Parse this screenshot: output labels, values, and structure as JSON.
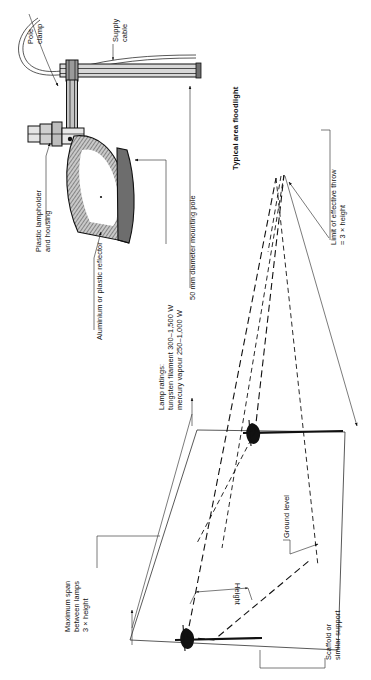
{
  "figure": {
    "title": "Typical area floodlight",
    "orientation": "rotated-90-ccw"
  },
  "upper_diagram": {
    "name": "floodlight-cross-section",
    "labels": {
      "pole_clamp": "Pole\nclamp",
      "supply_cable": "Supply\ncable",
      "lampholder": "Plastic lampholder\nand housing",
      "reflector": "Aluminium or plastic reflector",
      "lamp_ratings": "Lamp ratings:\ntungsten filament 300–1,500 W\nmercury vapour 250–1,000 W",
      "mounting_pole": "50 mm diameter mounting pole"
    },
    "values": {
      "pole_diameter_mm": 50,
      "tungsten_filament_watts": "300–1,500 W",
      "mercury_vapour_watts": "250–1,000 W"
    }
  },
  "lower_diagram": {
    "name": "floodlight-coverage-geometry",
    "labels": {
      "limit_of_throw": "Limit of effective throw\n= 3 × height",
      "ground_level": "Ground level",
      "maximum_span": "Maximum span\nbetween lamps\n3 × height",
      "height": "Height",
      "scaffold": "Scaffold or\nsimilar support"
    },
    "values": {
      "effective_throw_rule": "3 × height",
      "max_span_rule": "3 × height"
    }
  },
  "colors": {
    "ink": "#111111",
    "paper": "#ffffff",
    "hatch_grey": "#9a9a9a",
    "metal_light": "#d8d8d8"
  }
}
